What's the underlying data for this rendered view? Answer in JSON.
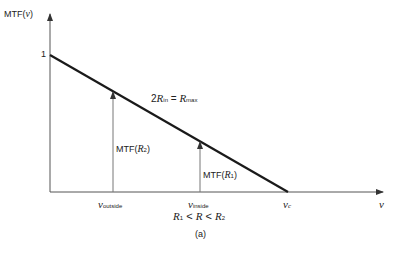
{
  "diagram": {
    "y_axis_label": {
      "prefix": "MTF(",
      "var": "ν",
      "suffix": ")"
    },
    "x_axis_label": "ν",
    "y_tick": "1",
    "line_label": {
      "lhs_coef": "2",
      "lhs_var": "R",
      "lhs_sub": "in",
      "eq": " = ",
      "rhs_var": "R",
      "rhs_sub": "max"
    },
    "arrow_left_label": {
      "prefix": "MTF(",
      "var": "R",
      "sub": "2",
      "suffix": ")"
    },
    "arrow_right_label": {
      "prefix": "MTF(",
      "var": "R",
      "sub": "1",
      "suffix": ")"
    },
    "x_ticks": [
      {
        "var": "ν",
        "sub": "outside"
      },
      {
        "var": "ν",
        "sub": "inside"
      },
      {
        "var": "ν",
        "sub": "c"
      }
    ],
    "condition": {
      "a": "R",
      "a_sub": "1",
      "lt1": " < ",
      "b": "R",
      "lt2": " < ",
      "c": "R",
      "c_sub": "2"
    },
    "caption": "(a)"
  },
  "colors": {
    "line": "#1a1a1a",
    "axis": "#555555",
    "arrow": "#777777"
  }
}
